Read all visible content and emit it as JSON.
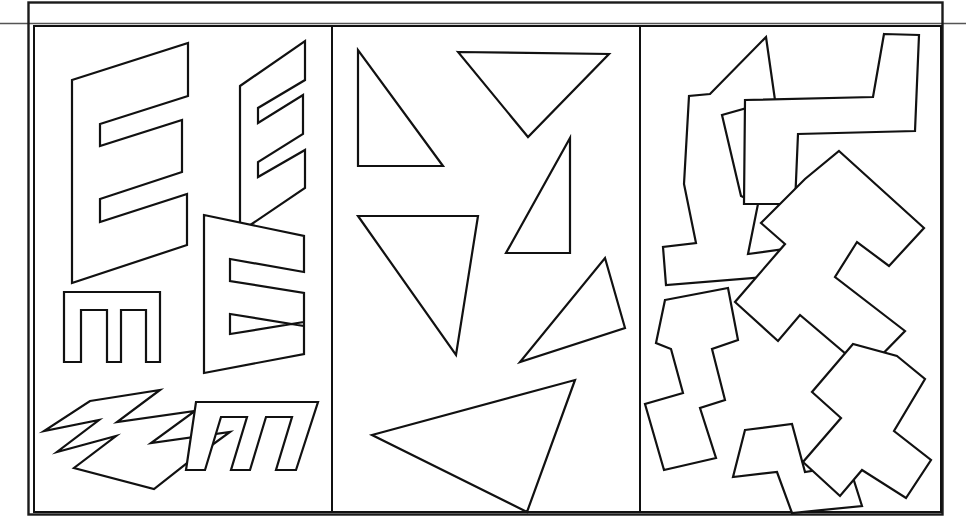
{
  "figure": {
    "background_color": "#ffffff",
    "stroke_color": "#111111",
    "frame": {
      "x": 28,
      "y": 2,
      "width": 915,
      "height": 513
    },
    "header_rule": {
      "x1": 0,
      "y1": 23,
      "x2": 966,
      "y2": 23
    },
    "panels": [
      {
        "id": "panel-letter-e",
        "label": "E shapes",
        "category": "letter-E outlines",
        "rect": {
          "x": 33,
          "y": 25,
          "width": 299,
          "height": 487
        },
        "shape_count": 6
      },
      {
        "id": "panel-triangles",
        "label": "Triangles",
        "category": "triangle outlines",
        "rect": {
          "x": 332,
          "y": 25,
          "width": 308,
          "height": 487
        },
        "shape_count": 6
      },
      {
        "id": "panel-zigzags",
        "label": "Zigzags",
        "category": "zigzag polyline outlines",
        "rect": {
          "x": 640,
          "y": 25,
          "width": 301,
          "height": 487
        },
        "shape_count": 6
      }
    ]
  },
  "chart_data": {
    "type": "scatter",
    "title": "",
    "xlabel": "",
    "ylabel": "",
    "categories": [
      "E shapes",
      "Triangles",
      "Zigzags"
    ],
    "values": [
      6,
      6,
      6
    ],
    "grid": false,
    "legend": "none"
  },
  "shapes": {
    "panel_e": [
      {
        "name": "large-slanted-e",
        "points": "72,80 188,43 188,96 100,124 100,146 182,120 182,172 100,199 100,222 187,194 187,245 72,283"
      },
      {
        "name": "medium-slanted-e-top-right",
        "points": "240,86 305,41 305,80 258,108 258,123 303,95 303,134 258,162 258,177 305,150 305,188 240,232"
      },
      {
        "name": "medium-slanted-e-middle-right",
        "points": "204,215 304,236 304,272 230,259 230,281 304,293 304,326 230,314 230,334 304,322 304,354 204,373"
      },
      {
        "name": "rotated-e-small",
        "points": "64,292 160,292 160,362 146,362 146,310 121,310 121,362 107,362 107,310 81,310 81,362 64,362"
      },
      {
        "name": "rotated-slanted-e-bottom-left",
        "points": "90,401 160,390 117,422 195,411 151,443 230,432 186,464 154,489 74,468 116,436 57,452 99,420 44,431"
      },
      {
        "name": "slanted-w-e-bottom-right",
        "points": "196,402 318,402 296,470 276,470 292,417 266,417 250,470 231,470 247,417 221,417 205,470 186,470"
      }
    ],
    "panel_triangles": [
      {
        "name": "right-triangle-upper-left",
        "points": "358,50 358,166 443,166"
      },
      {
        "name": "inverted-triangle-top",
        "points": "458,52 609,54 528,137"
      },
      {
        "name": "right-triangle-middle-right",
        "points": "570,138 570,253 506,253"
      },
      {
        "name": "right-triangle-large-left",
        "points": "358,216 478,216 456,355"
      },
      {
        "name": "slim-triangle-middle-right-lower",
        "points": "605,258 625,328 520,362"
      },
      {
        "name": "large-triangle-bottom",
        "points": "372,435 575,380 527,512"
      }
    ],
    "panel_zigzags": [
      {
        "name": "zigzag-upper-left",
        "points": "766,37 775,100 722,115 741,196 758,204 748,254 806,246 803,274 666,285 663,247 696,243 684,184 689,96 710,94"
      },
      {
        "name": "zigzag-upper-right",
        "points": "884,34 919,35 915,131 798,134 795,204 744,204 745,100 873,97"
      },
      {
        "name": "zigzag-middle-right",
        "points": "839,151 924,228 889,266 857,242 835,277 905,331 866,371 800,315 778,341 735,302 785,244 761,223 805,179"
      },
      {
        "name": "zigzag-lower-left",
        "points": "665,300 728,288 738,340 712,349 725,400 700,408 716,458 664,470 645,404 683,393 671,349 656,343"
      },
      {
        "name": "zigzag-lower-middle",
        "points": "745,430 792,424 805,472 849,465 862,506 792,513 777,472 733,477"
      },
      {
        "name": "zigzag-lower-right",
        "points": "897,356 925,379 894,431 931,460 906,498 862,470 840,496 803,462 841,418 812,392 853,344"
      }
    ]
  }
}
